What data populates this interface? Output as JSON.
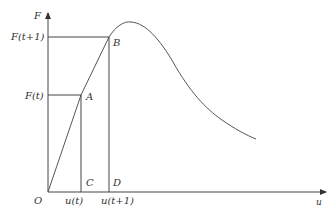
{
  "diagram": {
    "axes": {
      "y_label": "F",
      "x_label": "u",
      "origin_label": "O"
    },
    "y_ticks": [
      {
        "label": "F(t+1)"
      },
      {
        "label": "F(t)"
      }
    ],
    "x_ticks": [
      {
        "label": "u(t)"
      },
      {
        "label": "u(t+1)"
      }
    ],
    "points": {
      "A": "A",
      "B": "B",
      "C": "C",
      "D": "D"
    },
    "colors": {
      "line": "#444444",
      "curve": "#555555",
      "background": "#ffffff"
    }
  }
}
